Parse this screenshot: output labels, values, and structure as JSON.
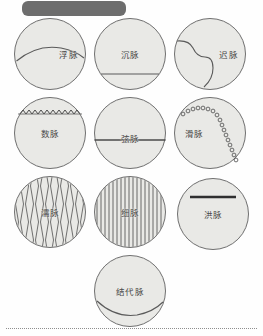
{
  "page": {
    "background_color": "#fefefe",
    "width": 263,
    "height": 336
  },
  "header": {
    "redacted_banner_label": "",
    "color": "#6d6d6d"
  },
  "figure": {
    "circle_fill": "#e9e9e6",
    "circle_stroke": "#6f6f6f",
    "label_color": "#4a4a4a",
    "items": [
      {
        "label": "浮脉",
        "pattern": "arc-near-top",
        "row": 1,
        "column": 1
      },
      {
        "label": "沉脉",
        "pattern": "chord-near-bottom",
        "row": 1,
        "column": 2
      },
      {
        "label": "迟脉",
        "pattern": "s-curve-vertical",
        "row": 1,
        "column": 3
      },
      {
        "label": "数脉",
        "pattern": "zigzag-near-top",
        "row": 2,
        "column": 1
      },
      {
        "label": "弦脉",
        "pattern": "straight-chord-middle",
        "row": 2,
        "column": 2
      },
      {
        "label": "滑脉",
        "pattern": "bead-curve",
        "row": 2,
        "column": 3
      },
      {
        "label": "濡脉",
        "pattern": "wavy-vertical-lines",
        "row": 3,
        "column": 1
      },
      {
        "label": "细脉",
        "pattern": "straight-vertical-lines",
        "row": 3,
        "column": 2
      },
      {
        "label": "洪脉",
        "pattern": "thick-bar-upper",
        "row": 3,
        "column": 3
      },
      {
        "label": "结代脉",
        "pattern": "arc-near-bottom",
        "row": 4,
        "column": 2
      }
    ]
  },
  "footer": {
    "rule_style": "dotted"
  }
}
